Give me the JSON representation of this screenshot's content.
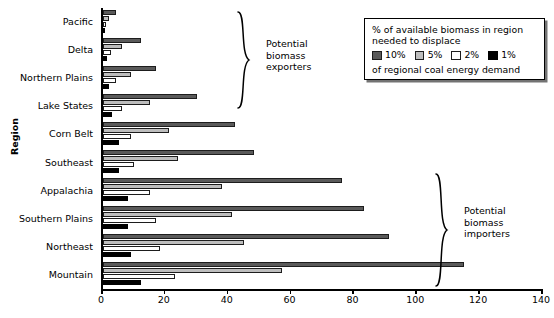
{
  "chart_data": {
    "type": "bar",
    "orientation": "horizontal",
    "title": "",
    "xlabel": "",
    "ylabel": "Region",
    "xlim": [
      0,
      140
    ],
    "xticks": [
      0,
      20,
      40,
      60,
      80,
      100,
      120,
      140
    ],
    "grid": false,
    "legend_position": "top-right",
    "categories": [
      "Pacific",
      "Delta",
      "Northern Plains",
      "Lake States",
      "Corn Belt",
      "Southeast",
      "Appalachia",
      "Southern Plains",
      "Northeast",
      "Mountain"
    ],
    "series": [
      {
        "name": "10%",
        "color": "#5a5a5a",
        "values": [
          4,
          12,
          17,
          30,
          42,
          48,
          76,
          83,
          91,
          115
        ]
      },
      {
        "name": "5%",
        "color": "#bdbdbd",
        "values": [
          2,
          6,
          9,
          15,
          21,
          24,
          38,
          41,
          45,
          57
        ]
      },
      {
        "name": "2%",
        "color": "#ffffff",
        "values": [
          0.8,
          2.5,
          4,
          6,
          9,
          10,
          15,
          17,
          18,
          23
        ]
      },
      {
        "name": "1%",
        "color": "#000000",
        "values": [
          0.4,
          1.3,
          2,
          3,
          5,
          5,
          8,
          8,
          9,
          12
        ]
      }
    ],
    "annotations": [
      {
        "id": "exporters",
        "text": "Potential\nbiomass\nexporters",
        "covers": [
          "Pacific",
          "Delta",
          "Northern Plains",
          "Lake States"
        ]
      },
      {
        "id": "importers",
        "text": "Potential\nbiomass\nimporters",
        "covers": [
          "Appalachia",
          "Southern Plains",
          "Northeast",
          "Mountain"
        ]
      }
    ]
  },
  "axis": {
    "y_title": "Region",
    "x_tick_labels": [
      "0",
      "20",
      "40",
      "60",
      "80",
      "100",
      "120",
      "140"
    ]
  },
  "legend": {
    "line1": "% of available biomass in region",
    "line2": "needed to displace",
    "line3": "of regional coal energy demand",
    "keys": [
      {
        "label": "10%",
        "color": "#5a5a5a"
      },
      {
        "label": "5%",
        "color": "#bdbdbd"
      },
      {
        "label": "2%",
        "color": "#ffffff"
      },
      {
        "label": "1%",
        "color": "#000000"
      }
    ]
  },
  "annotations": {
    "exporters": {
      "line1": "Potential",
      "line2": "biomass",
      "line3": "exporters"
    },
    "importers": {
      "line1": "Potential",
      "line2": "biomass",
      "line3": "importers"
    }
  }
}
